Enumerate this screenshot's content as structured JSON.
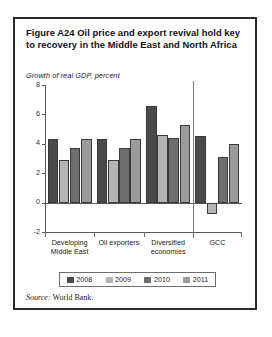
{
  "figure": {
    "title": "Figure A24  Oil price and export revival hold key to recovery in the Middle East and North Africa",
    "axis_note": "Growth of real GDP, percent",
    "source_label": "Source:",
    "source_value": "World Bank."
  },
  "legend": {
    "items": [
      {
        "label": "2008",
        "color": "#4a4a4a"
      },
      {
        "label": "2009",
        "color": "#b4b4b4"
      },
      {
        "label": "2010",
        "color": "#6e6e6e"
      },
      {
        "label": "2011",
        "color": "#9b9b9b"
      }
    ]
  },
  "chart_data": {
    "type": "bar",
    "title": "Figure A24  Oil price and export revival hold key to recovery in the Middle East and North Africa",
    "subtitle": "Growth of real GDP, percent",
    "xlabel": "",
    "ylabel": "Growth of real GDP, percent",
    "ylim": [
      -2,
      8
    ],
    "yticks": [
      8,
      6,
      4,
      2,
      0,
      -2
    ],
    "grid": false,
    "legend_position": "bottom",
    "categories": [
      "Developing Middle East",
      "Oil exporters",
      "Diversified economies",
      "GCC"
    ],
    "series": [
      {
        "name": "2008",
        "color": "#4a4a4a",
        "values": [
          4.3,
          4.3,
          6.6,
          4.5
        ]
      },
      {
        "name": "2009",
        "color": "#b4b4b4",
        "values": [
          2.9,
          2.9,
          4.6,
          -0.8
        ]
      },
      {
        "name": "2010",
        "color": "#6e6e6e",
        "values": [
          3.7,
          3.7,
          4.4,
          3.1
        ]
      },
      {
        "name": "2011",
        "color": "#9b9b9b",
        "values": [
          4.35,
          4.35,
          5.3,
          4.0
        ]
      }
    ]
  }
}
